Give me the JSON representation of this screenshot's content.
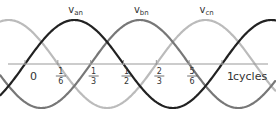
{
  "chart_data": {
    "type": "line",
    "title": "",
    "xlabel": "cycles",
    "ylabel": "",
    "xlim": [
      -0.125,
      1.27
    ],
    "ylim": [
      -1,
      1
    ],
    "grid": false,
    "x_ticks": [
      {
        "value": 0,
        "label": "0"
      },
      {
        "value": 0.16667,
        "num": "1",
        "den": "6"
      },
      {
        "value": 0.33333,
        "num": "1",
        "den": "3"
      },
      {
        "value": 0.5,
        "num": "1",
        "den": "2"
      },
      {
        "value": 0.66667,
        "num": "2",
        "den": "3"
      },
      {
        "value": 0.83333,
        "num": "5",
        "den": "6"
      },
      {
        "value": 1,
        "label": "1"
      }
    ],
    "series": [
      {
        "name": "Van",
        "base": "v",
        "sub": "an",
        "phase_cycles": 0,
        "amplitude": 1,
        "color": "#222222",
        "peak_label_at": 0.25
      },
      {
        "name": "Vbn",
        "base": "v",
        "sub": "bn",
        "phase_cycles": 0.33333,
        "amplitude": 1,
        "color": "#777777",
        "peak_label_at": 0.58333
      },
      {
        "name": "Vcn",
        "base": "v",
        "sub": "cn",
        "phase_cycles": 0.66667,
        "amplitude": 1,
        "color": "#bbbbbb",
        "peak_label_at": 0.91667
      }
    ]
  }
}
